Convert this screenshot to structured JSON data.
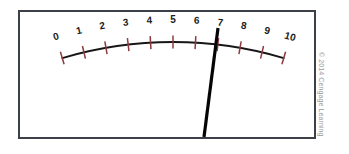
{
  "figure": {
    "frame_color": "#3c4048",
    "background_color": "#ffffff",
    "arc_color": "#161616",
    "tick_color": "#8d3b40",
    "label_color": "#1b1b1b",
    "needle_color": "#050505"
  },
  "copyright": {
    "text": "© 2014 Cengage Learning"
  },
  "chart_data": {
    "type": "gauge",
    "xlabel": "",
    "ylabel": "",
    "scale_min": 0,
    "scale_max": 10,
    "tick_step": 1,
    "needle_reading": 7,
    "grid": false,
    "legend": "none",
    "categories": [
      "0",
      "1",
      "2",
      "3",
      "4",
      "5",
      "6",
      "7",
      "8",
      "9",
      "10"
    ],
    "values": [
      0,
      1,
      2,
      3,
      4,
      5,
      6,
      7,
      8,
      9,
      10
    ],
    "tick_labels": [
      {
        "value": 0,
        "label": "0"
      },
      {
        "value": 1,
        "label": "1"
      },
      {
        "value": 2,
        "label": "2"
      },
      {
        "value": 3,
        "label": "3"
      },
      {
        "value": 4,
        "label": "4"
      },
      {
        "value": 5,
        "label": "5"
      },
      {
        "value": 6,
        "label": "6"
      },
      {
        "value": 7,
        "label": "7"
      },
      {
        "value": 8,
        "label": "8"
      },
      {
        "value": 9,
        "label": "9"
      },
      {
        "value": 10,
        "label": "10"
      }
    ],
    "arc_geometry": {
      "center_x": 173,
      "center_y": 432,
      "radius": 390,
      "start_angle_deg": -106.5,
      "end_angle_deg": -73.5
    },
    "needle_geometry": {
      "tip_x": 218,
      "tip_y": 28,
      "tail_x": 204,
      "tail_y": 137
    }
  }
}
